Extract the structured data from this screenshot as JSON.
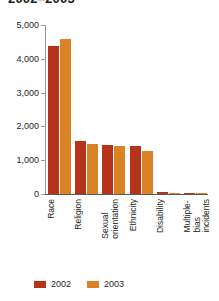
{
  "chart_data": {
    "type": "bar",
    "title": "2002–2003",
    "xlabel": "",
    "ylabel": "",
    "ylim": [
      0,
      5000
    ],
    "ytick_values": [
      0,
      1000,
      2000,
      3000,
      4000,
      5000
    ],
    "ytick_labels": [
      "0",
      "1,000",
      "2,000",
      "3,000",
      "4,000",
      "5,000"
    ],
    "grid": false,
    "legend_position": "bottom-left",
    "categories": [
      "Race",
      "Religion",
      "Sexual orientation",
      "Ethnicity",
      "Disability",
      "Multiple-bias incidents"
    ],
    "series": [
      {
        "name": "2002",
        "color": "#b5331a",
        "values": [
          4393,
          1576,
          1464,
          1409,
          45,
          5
        ]
      },
      {
        "name": "2003",
        "color": "#d98324",
        "values": [
          4574,
          1489,
          1430,
          1283,
          33,
          6
        ]
      }
    ]
  },
  "colors": {
    "series_2002": "#b5331a",
    "series_2003": "#d98324",
    "axis": "#58595b",
    "axis_light": "#9c9a9b",
    "text": "#231f20",
    "background": "#ffffff"
  },
  "legend": {
    "items": [
      {
        "label": "2002",
        "color": "#b5331a"
      },
      {
        "label": "2003",
        "color": "#d98324"
      }
    ]
  }
}
